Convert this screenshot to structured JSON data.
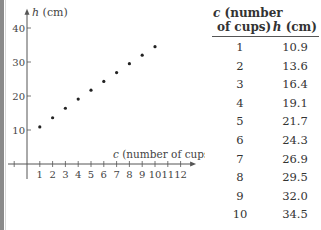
{
  "chart_data": {
    "type": "scatter",
    "title": "",
    "xlabel_var": "c",
    "xlabel_rest": " (number of cups)",
    "ylabel_var": "h",
    "ylabel_rest": " (cm)",
    "x": [
      1,
      2,
      3,
      4,
      5,
      6,
      7,
      8,
      9,
      10
    ],
    "y": [
      10.9,
      13.6,
      16.4,
      19.1,
      21.7,
      24.3,
      26.9,
      29.5,
      32.0,
      34.5
    ],
    "xticks": [
      1,
      2,
      3,
      4,
      5,
      6,
      7,
      8,
      9,
      10,
      11,
      12
    ],
    "yticks": [
      10,
      20,
      30,
      40
    ],
    "xlim": [
      -1.5,
      12.8
    ],
    "ylim": [
      -4,
      44
    ],
    "grid": false,
    "legend": "none"
  },
  "table": {
    "header_c_var": "c",
    "header_c_rest1": " (number",
    "header_c_rest2": "of cups)",
    "header_h_var": "h",
    "header_h_rest": " (cm)",
    "rows": [
      {
        "c": "1",
        "h": "10.9"
      },
      {
        "c": "2",
        "h": "13.6"
      },
      {
        "c": "3",
        "h": "16.4"
      },
      {
        "c": "4",
        "h": "19.1"
      },
      {
        "c": "5",
        "h": "21.7"
      },
      {
        "c": "6",
        "h": "24.3"
      },
      {
        "c": "7",
        "h": "26.9"
      },
      {
        "c": "8",
        "h": "29.5"
      },
      {
        "c": "9",
        "h": "32.0"
      },
      {
        "c": "10",
        "h": "34.5"
      }
    ]
  }
}
